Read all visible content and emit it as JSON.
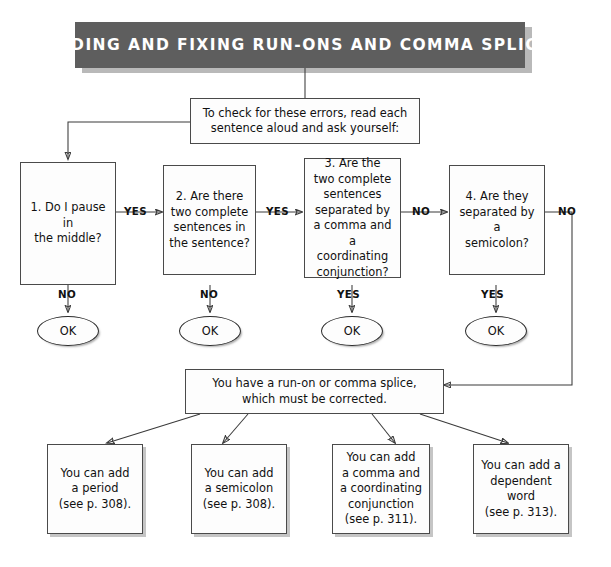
{
  "header": {
    "title": "FINDING AND FIXING RUN-ONS AND COMMA SPLICES",
    "background_color": "#5e5e5e",
    "text_color": "#ffffff",
    "shadow_color": "#b9b9b9"
  },
  "intro": {
    "text": "To check for these errors, read each\nsentence aloud and ask yourself:"
  },
  "questions": [
    {
      "id": "q1",
      "text": "1. Do I pause in\nthe middle?",
      "yes_label": "YES",
      "no_label": "NO"
    },
    {
      "id": "q2",
      "text": "2. Are there\ntwo complete\nsentences in\nthe sentence?",
      "yes_label": "YES",
      "no_label": "NO"
    },
    {
      "id": "q3",
      "text": "3. Are the\ntwo complete\nsentences\nseparated by\na comma and a\ncoordinating\nconjunction?",
      "yes_label": "YES",
      "no_label": "NO"
    },
    {
      "id": "q4",
      "text": "4. Are they\nseparated by a\nsemicolon?",
      "yes_label": "YES",
      "no_label": "NO"
    }
  ],
  "terminals": [
    {
      "id": "ok1",
      "text": "OK"
    },
    {
      "id": "ok2",
      "text": "OK"
    },
    {
      "id": "ok3",
      "text": "OK"
    },
    {
      "id": "ok4",
      "text": "OK"
    }
  ],
  "verdict": {
    "text": "You have a run-on or comma splice,\nwhich must be corrected."
  },
  "remedies": [
    {
      "id": "r1",
      "text": "You can add\na period\n(see p. 308)."
    },
    {
      "id": "r2",
      "text": "You can add\na semicolon\n(see p. 308)."
    },
    {
      "id": "r3",
      "text": "You can add\na comma and\na coordinating\nconjunction\n(see p. 311)."
    },
    {
      "id": "r4",
      "text": "You can add a\ndependent\nword\n(see p. 313)."
    }
  ],
  "edge_labels": {
    "q1_yes": "YES",
    "q1_no": "NO",
    "q2_yes": "YES",
    "q2_no": "NO",
    "q3_no": "NO",
    "q3_yes": "YES",
    "q4_no": "NO",
    "q4_yes": "YES"
  },
  "colors": {
    "line": "#3a3a3a",
    "box_border": "#4a4a4a",
    "box_fill": "#fdfdfd",
    "page_background": "#ffffff"
  }
}
